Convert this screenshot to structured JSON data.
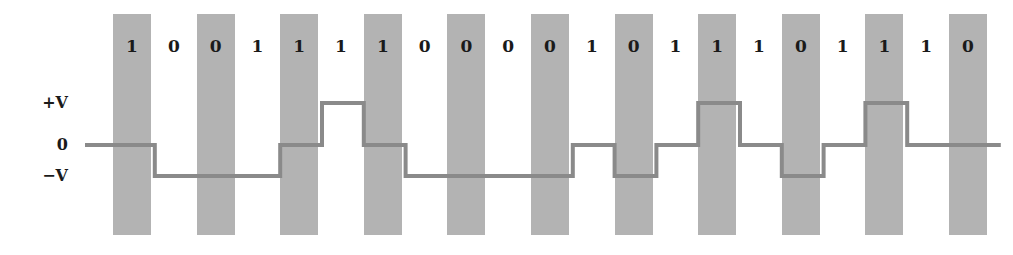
{
  "figure": {
    "width": 1013,
    "height": 255,
    "background_color": "#ffffff"
  },
  "axis_labels": [
    {
      "name": "plus-v",
      "text": "+V",
      "level": "+V"
    },
    {
      "name": "zero",
      "text": "0",
      "level": "0"
    },
    {
      "name": "minus-v",
      "text": "−V",
      "level": "-V"
    }
  ],
  "bits": [
    "1",
    "0",
    "0",
    "1",
    "1",
    "1",
    "1",
    "0",
    "0",
    "0",
    "0",
    "1",
    "0",
    "1",
    "1",
    "1",
    "0",
    "1",
    "1",
    "1",
    "0"
  ],
  "chart_data": {
    "type": "line",
    "title": "",
    "xlabel": "",
    "ylabel": "",
    "encoding": "pseudoternary",
    "grid": false,
    "legend": false,
    "bit_sequence": [
      1,
      0,
      0,
      1,
      1,
      1,
      1,
      0,
      0,
      0,
      0,
      1,
      0,
      1,
      1,
      1,
      0,
      1,
      1,
      1,
      0
    ],
    "y_levels": [
      "+V",
      "0",
      "-V"
    ],
    "ylim": [
      "-V",
      "+V"
    ],
    "signal_levels": [
      "0",
      "-V",
      "-V",
      "-V",
      "0",
      "+V",
      "0",
      "-V",
      "-V",
      "-V",
      "-V",
      "0",
      "-V",
      "0",
      "+V",
      "0",
      "-V",
      "0",
      "+V",
      "0",
      "0"
    ],
    "series": [
      {
        "name": "line-signal",
        "values": [
          0,
          -1,
          -1,
          -1,
          0,
          1,
          0,
          -1,
          -1,
          -1,
          -1,
          0,
          -1,
          0,
          1,
          0,
          -1,
          0,
          1,
          0,
          0
        ]
      }
    ],
    "colors": {
      "waveform": "#8a8a8a",
      "bit_cell_shading": "#b3b3b3",
      "text": "#1a1a1a",
      "background": "#ffffff"
    }
  },
  "geometry": {
    "bit_start_x": 113,
    "bit_pitch": 41.8,
    "bar_width": 38,
    "bar_top": 14,
    "bar_bottom": 235,
    "level_y_plus": 103,
    "level_y_zero": 145,
    "level_y_minus": 176,
    "digit_y": 38,
    "lead_in_x": 85,
    "label_x_right": 68
  }
}
